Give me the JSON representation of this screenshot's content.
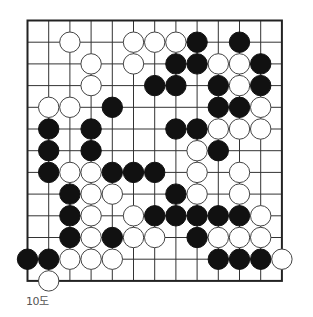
{
  "diagram": {
    "caption": "10도",
    "grid": {
      "columns": 13,
      "rows": 13,
      "origin_x": 27.5,
      "origin_y": 20.5,
      "spacing_x": 21.2,
      "spacing_y": 21.7,
      "stone_radius": 10.2
    },
    "colors": {
      "line": "#333333",
      "border": "#222222",
      "black_stone": "#111111",
      "white_stone": "#ffffff",
      "white_stone_outline": "#444444"
    },
    "stones": [
      {
        "color": "white",
        "col": 2,
        "row": 1
      },
      {
        "color": "white",
        "col": 5,
        "row": 1
      },
      {
        "color": "white",
        "col": 6,
        "row": 1
      },
      {
        "color": "white",
        "col": 7,
        "row": 1
      },
      {
        "color": "black",
        "col": 8,
        "row": 1
      },
      {
        "color": "black",
        "col": 10,
        "row": 1
      },
      {
        "color": "white",
        "col": 3,
        "row": 2
      },
      {
        "color": "white",
        "col": 5,
        "row": 2
      },
      {
        "color": "black",
        "col": 7,
        "row": 2
      },
      {
        "color": "black",
        "col": 8,
        "row": 2
      },
      {
        "color": "white",
        "col": 9,
        "row": 2
      },
      {
        "color": "white",
        "col": 10,
        "row": 2
      },
      {
        "color": "black",
        "col": 11,
        "row": 2
      },
      {
        "color": "white",
        "col": 3,
        "row": 3
      },
      {
        "color": "black",
        "col": 6,
        "row": 3
      },
      {
        "color": "black",
        "col": 7,
        "row": 3
      },
      {
        "color": "black",
        "col": 9,
        "row": 3
      },
      {
        "color": "white",
        "col": 10,
        "row": 3
      },
      {
        "color": "black",
        "col": 11,
        "row": 3
      },
      {
        "color": "white",
        "col": 1,
        "row": 4
      },
      {
        "color": "white",
        "col": 2,
        "row": 4
      },
      {
        "color": "black",
        "col": 4,
        "row": 4
      },
      {
        "color": "black",
        "col": 9,
        "row": 4
      },
      {
        "color": "black",
        "col": 10,
        "row": 4
      },
      {
        "color": "white",
        "col": 11,
        "row": 4
      },
      {
        "color": "black",
        "col": 1,
        "row": 5
      },
      {
        "color": "black",
        "col": 3,
        "row": 5
      },
      {
        "color": "black",
        "col": 7,
        "row": 5
      },
      {
        "color": "black",
        "col": 8,
        "row": 5
      },
      {
        "color": "white",
        "col": 9,
        "row": 5
      },
      {
        "color": "white",
        "col": 10,
        "row": 5
      },
      {
        "color": "white",
        "col": 11,
        "row": 5
      },
      {
        "color": "black",
        "col": 1,
        "row": 6
      },
      {
        "color": "black",
        "col": 3,
        "row": 6
      },
      {
        "color": "white",
        "col": 8,
        "row": 6
      },
      {
        "color": "black",
        "col": 9,
        "row": 6
      },
      {
        "color": "black",
        "col": 1,
        "row": 7
      },
      {
        "color": "white",
        "col": 2,
        "row": 7
      },
      {
        "color": "white",
        "col": 3,
        "row": 7
      },
      {
        "color": "black",
        "col": 4,
        "row": 7
      },
      {
        "color": "black",
        "col": 5,
        "row": 7
      },
      {
        "color": "black",
        "col": 6,
        "row": 7
      },
      {
        "color": "white",
        "col": 8,
        "row": 7
      },
      {
        "color": "white",
        "col": 10,
        "row": 7
      },
      {
        "color": "black",
        "col": 2,
        "row": 8
      },
      {
        "color": "white",
        "col": 3,
        "row": 8
      },
      {
        "color": "white",
        "col": 4,
        "row": 8
      },
      {
        "color": "black",
        "col": 7,
        "row": 8
      },
      {
        "color": "white",
        "col": 8,
        "row": 8
      },
      {
        "color": "white",
        "col": 10,
        "row": 8
      },
      {
        "color": "black",
        "col": 2,
        "row": 9
      },
      {
        "color": "white",
        "col": 3,
        "row": 9
      },
      {
        "color": "white",
        "col": 5,
        "row": 9
      },
      {
        "color": "black",
        "col": 6,
        "row": 9
      },
      {
        "color": "black",
        "col": 7,
        "row": 9
      },
      {
        "color": "black",
        "col": 8,
        "row": 9
      },
      {
        "color": "black",
        "col": 9,
        "row": 9
      },
      {
        "color": "black",
        "col": 10,
        "row": 9
      },
      {
        "color": "white",
        "col": 11,
        "row": 9
      },
      {
        "color": "black",
        "col": 2,
        "row": 10
      },
      {
        "color": "white",
        "col": 3,
        "row": 10
      },
      {
        "color": "black",
        "col": 4,
        "row": 10
      },
      {
        "color": "white",
        "col": 5,
        "row": 10
      },
      {
        "color": "white",
        "col": 6,
        "row": 10
      },
      {
        "color": "black",
        "col": 8,
        "row": 10
      },
      {
        "color": "white",
        "col": 9,
        "row": 10
      },
      {
        "color": "white",
        "col": 10,
        "row": 10
      },
      {
        "color": "white",
        "col": 11,
        "row": 10
      },
      {
        "color": "black",
        "col": 0,
        "row": 11
      },
      {
        "color": "black",
        "col": 1,
        "row": 11
      },
      {
        "color": "white",
        "col": 2,
        "row": 11
      },
      {
        "color": "white",
        "col": 3,
        "row": 11
      },
      {
        "color": "white",
        "col": 4,
        "row": 11
      },
      {
        "color": "black",
        "col": 9,
        "row": 11
      },
      {
        "color": "black",
        "col": 10,
        "row": 11
      },
      {
        "color": "black",
        "col": 11,
        "row": 11
      },
      {
        "color": "white",
        "col": 12,
        "row": 11
      },
      {
        "color": "white",
        "col": 1,
        "row": 12
      }
    ]
  }
}
